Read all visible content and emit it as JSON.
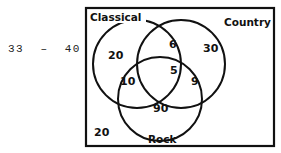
{
  "question_range": "33  –  40",
  "diagram": {
    "type": "venn",
    "sets": [
      {
        "name": "Classical",
        "label": "Classical"
      },
      {
        "name": "Country",
        "label": "Country"
      },
      {
        "name": "Rock",
        "label": "Rock"
      }
    ],
    "regions": {
      "classical_only": "20",
      "country_only": "30",
      "rock_only": "90",
      "classical_country": "6",
      "classical_rock": "10",
      "country_rock": "9",
      "all_three": "5",
      "outside": "20"
    }
  }
}
